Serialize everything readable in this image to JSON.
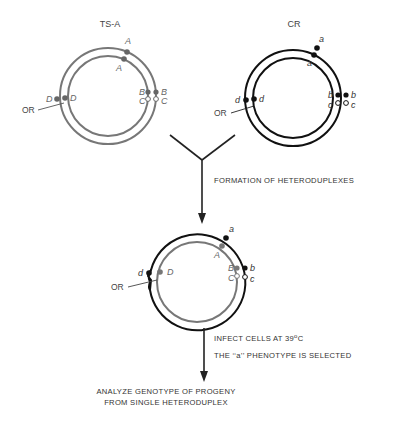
{
  "diagram": {
    "parents": [
      {
        "title": "TS-A",
        "strand_color": "#777777",
        "outer_labels": {
          "a": "A",
          "b": "B",
          "c": "C",
          "d": "D"
        },
        "inner_labels": {
          "a": "A",
          "b": "B",
          "c": "C",
          "d": "D"
        },
        "origin_label": "OR"
      },
      {
        "title": "CR",
        "strand_color": "#111111",
        "outer_labels": {
          "a": "a",
          "b": "b",
          "c": "c",
          "d": "d"
        },
        "inner_labels": {
          "a": "a",
          "b": "b",
          "c": "c",
          "d": "d"
        },
        "origin_label": "OR"
      }
    ],
    "step1": {
      "label": "FORMATION OF HETERODUPLEXES"
    },
    "heteroduplex": {
      "outer_strand_color": "#111111",
      "inner_strand_color": "#777777",
      "outer_labels": {
        "a": "a",
        "b": "b",
        "c": "c",
        "d": "d"
      },
      "inner_labels": {
        "a": "A",
        "b": "B",
        "c": "C",
        "d": "D"
      },
      "origin_label": "OR"
    },
    "step2": {
      "line1": "INFECT CELLS AT 39",
      "line1_sup": "o",
      "line1_end": "C",
      "line2": "THE ‘‘a’’ PHENOTYPE IS SELECTED"
    },
    "result": {
      "line1": "ANALYZE GENOTYPE OF PROGENY",
      "line2": "FROM SINGLE HETERODUPLEX"
    }
  }
}
